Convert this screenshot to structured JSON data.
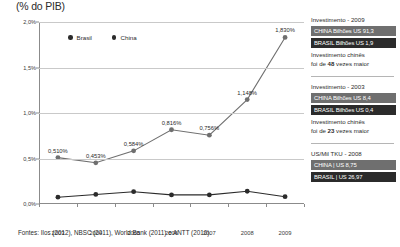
{
  "chart_data": {
    "type": "line",
    "title": "(% do PIB)",
    "xlabel": "",
    "ylabel": "",
    "ylim": [
      0.0,
      2.0
    ],
    "ytick_labels": [
      "0,0%",
      "0,5%",
      "1,0%",
      "1,5%",
      "2,0%"
    ],
    "ytick_values": [
      0.0,
      0.5,
      1.0,
      1.5,
      2.0
    ],
    "grid": true,
    "legend_position": "top-center",
    "categories": [
      "2003",
      "2004",
      "2005",
      "2006",
      "2007",
      "2008",
      "2009"
    ],
    "series": [
      {
        "name": "Brasil",
        "color": "#2b2b2b",
        "values": [
          0.075,
          0.105,
          0.135,
          0.1,
          0.1,
          0.14,
          0.08
        ],
        "labels": [
          "",
          "",
          "",
          "",
          "",
          "",
          ""
        ]
      },
      {
        "name": "China",
        "color": "#6f6f6f",
        "values": [
          0.51,
          0.453,
          0.584,
          0.816,
          0.756,
          1.148,
          1.83
        ],
        "labels": [
          "0,510%",
          "0,453%",
          "0,584%",
          "0,816%",
          "0,756%",
          "1,148%",
          "1,830%"
        ]
      }
    ],
    "source_note": "Fontes: Ilos (2012), NBSC (2011), World Bank (2011) e ANTT (2010)."
  },
  "sidebar": {
    "blocks": [
      {
        "heading": "Investimento - 2009",
        "china_bar": "CHINA Bilhões US 91,3",
        "brasil_bar": "BRASIL Bilhões US 1,9",
        "foot_line1": "Investimento chinês",
        "foot_prefix": "foi de ",
        "foot_strong": "48",
        "foot_suffix": " vezes maior"
      },
      {
        "heading": "Investimento - 2003",
        "china_bar": "CHINA Bilhões US 8,4",
        "brasil_bar": "BRASIL Bilhões US 0,4",
        "foot_line1": "Investimento chinês",
        "foot_prefix": "foi de ",
        "foot_strong": "23",
        "foot_suffix": " vezes maior"
      },
      {
        "heading": "US/Mil TKU - 2008",
        "china_bar": "CHINA  |  US 8,75",
        "brasil_bar": "BRASIL  |  US 26,97",
        "foot_line1": "",
        "foot_prefix": "",
        "foot_strong": "",
        "foot_suffix": ""
      }
    ]
  }
}
